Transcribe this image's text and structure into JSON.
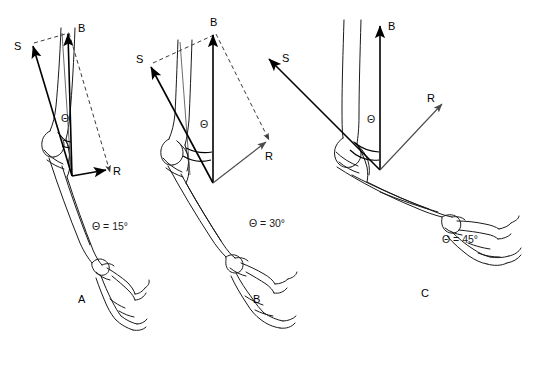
{
  "figure": {
    "background_color": "#ffffff",
    "ink_color": "#1a1a1a",
    "accent_color": "#4a4a4a"
  },
  "panels": [
    {
      "id": "A",
      "panel_label": "A",
      "angle_label": "Θ = 15°",
      "angle_symbol": "Θ",
      "angle_value": 15,
      "vectors": [
        {
          "name": "S",
          "label": "S",
          "style": "solid",
          "direction": "up-left",
          "description": "stabilizing component along humerus"
        },
        {
          "name": "B",
          "label": "B",
          "style": "solid",
          "direction": "up",
          "description": "biceps muscle force"
        },
        {
          "name": "R",
          "label": "R",
          "style": "solid",
          "direction": "right",
          "description": "rotary component perpendicular to forearm"
        }
      ]
    },
    {
      "id": "B",
      "panel_label": "B",
      "angle_label": "Θ = 30°",
      "angle_symbol": "Θ",
      "angle_value": 30,
      "vectors": [
        {
          "name": "S",
          "label": "S",
          "style": "solid",
          "direction": "up-left",
          "description": "stabilizing component along humerus"
        },
        {
          "name": "B",
          "label": "B",
          "style": "solid",
          "direction": "up",
          "description": "biceps muscle force"
        },
        {
          "name": "R",
          "label": "R",
          "style": "thin",
          "direction": "down-right",
          "description": "rotary component perpendicular to forearm"
        }
      ]
    },
    {
      "id": "C",
      "panel_label": "C",
      "angle_label": "Θ = 45°",
      "angle_symbol": "Θ",
      "angle_value": 45,
      "vectors": [
        {
          "name": "S",
          "label": "S",
          "style": "solid",
          "direction": "up-left",
          "description": "stabilizing component along humerus"
        },
        {
          "name": "B",
          "label": "B",
          "style": "solid",
          "direction": "up",
          "description": "biceps muscle force"
        },
        {
          "name": "R",
          "label": "R",
          "style": "thin",
          "direction": "up-right",
          "description": "rotary component perpendicular to forearm"
        }
      ]
    }
  ]
}
